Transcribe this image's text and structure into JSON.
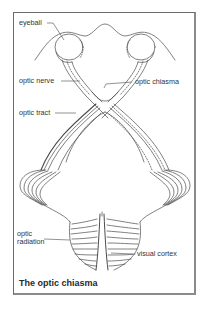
{
  "figure": {
    "title": "The optic chiasma",
    "labels": {
      "eyeball": "eyeball",
      "optic_nerve": "optic nerve",
      "optic_chiasma": "optic chiasma",
      "optic_tract": "optic tract",
      "optic_radiation_line1": "optic",
      "optic_radiation_line2": "radiation",
      "visual_cortex": "visual cortex"
    },
    "colors": {
      "line": "#4a4a4a",
      "frame": "#6a6a6a",
      "text": "#333333"
    }
  }
}
